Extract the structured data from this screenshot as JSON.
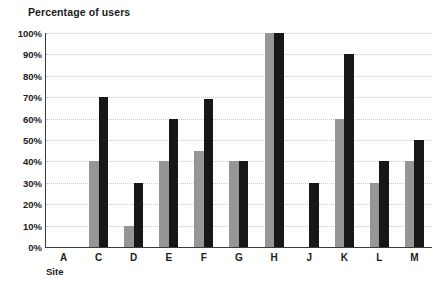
{
  "chart_data": {
    "type": "bar",
    "title": "Percentage of users",
    "xlabel": "Site",
    "ylabel": "Percentage of users",
    "categories": [
      "A",
      "C",
      "D",
      "E",
      "F",
      "G",
      "H",
      "J",
      "K",
      "L",
      "M"
    ],
    "series": [
      {
        "name": "series-gray",
        "color": "#969696",
        "values": [
          0,
          40,
          10,
          40,
          45,
          40,
          100,
          0,
          60,
          30,
          40
        ]
      },
      {
        "name": "series-black",
        "color": "#171717",
        "values": [
          0,
          70,
          30,
          60,
          69,
          40,
          100,
          30,
          90,
          40,
          50
        ]
      }
    ],
    "ylim": [
      0,
      100
    ],
    "ytick_labels": [
      "0%",
      "10%",
      "20%",
      "30%",
      "40%",
      "50%",
      "60%",
      "70%",
      "80%",
      "90%",
      "100%"
    ],
    "ytick_values": [
      0,
      10,
      20,
      30,
      40,
      50,
      60,
      70,
      80,
      90,
      100
    ],
    "grid": true,
    "grid_axis": "y",
    "grid_style": "dotted",
    "grid_color": "#c9c9c9",
    "legend": null,
    "legend_position": "none",
    "axis_color": "#3a3a3a",
    "background": "#ffffff"
  }
}
